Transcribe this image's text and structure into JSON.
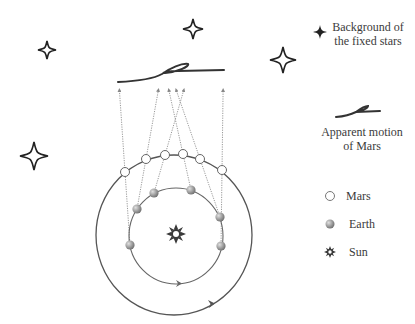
{
  "diagram": {
    "legend": {
      "fixed_stars": {
        "line1": "Background of",
        "line2": "the fixed stars",
        "icon": "four-point-star-icon"
      },
      "apparent_motion": {
        "line1": "Apparent motion",
        "line2": "of Mars",
        "icon": "retrograde-loop-icon"
      },
      "mars": {
        "label": "Mars",
        "icon": "white-circle-icon"
      },
      "earth": {
        "label": "Earth",
        "icon": "grey-sphere-icon"
      },
      "sun": {
        "label": "Sun",
        "icon": "sun-icon"
      }
    },
    "stars": [
      {
        "x": 47,
        "y": 50,
        "size": 9
      },
      {
        "x": 193,
        "y": 29,
        "size": 10
      },
      {
        "x": 283,
        "y": 60,
        "size": 13
      },
      {
        "x": 34,
        "y": 156,
        "size": 14
      }
    ],
    "mars_positions": [
      {
        "x": 125,
        "y": 172
      },
      {
        "x": 146,
        "y": 159
      },
      {
        "x": 165,
        "y": 155
      },
      {
        "x": 183,
        "y": 154
      },
      {
        "x": 200,
        "y": 159
      },
      {
        "x": 222,
        "y": 170
      }
    ],
    "earth_positions": [
      {
        "x": 130,
        "y": 245
      },
      {
        "x": 137,
        "y": 209
      },
      {
        "x": 154,
        "y": 193
      },
      {
        "x": 191,
        "y": 190
      },
      {
        "x": 220,
        "y": 217
      },
      {
        "x": 221,
        "y": 246
      }
    ],
    "sight_line_tops_x": [
      120,
      158,
      168,
      175,
      184,
      223
    ],
    "sight_line_top_y": 90,
    "colors": {
      "orbit": "#555555",
      "sight_line": "#9a9a9a",
      "ink": "#333333",
      "earth_fill": "#9e9e9e"
    }
  }
}
